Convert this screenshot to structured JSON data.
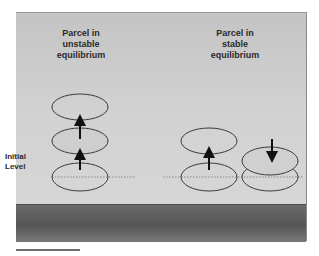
{
  "diagram": {
    "left_title": "Parcel in unstable equilibrium",
    "left_title_lines": [
      "Parcel in",
      "unstable",
      "equilibrium"
    ],
    "right_title": "Parcel in stable equilibrium",
    "right_title_lines": [
      "Parcel in",
      "stable",
      "equilibrium"
    ],
    "level_label_lines": [
      "Initial",
      "Level"
    ],
    "colors": {
      "background": "#d0d0d0",
      "ground": "#5e5e5e",
      "outline": "#3a3a3a",
      "arrow": "#111111",
      "level_line": "#777777"
    },
    "left_parcels": [
      "initial",
      "middle",
      "top"
    ],
    "right_parcels": [
      "initial-up",
      "displaced-up",
      "initial-down",
      "displaced-down"
    ],
    "arrows": {
      "left": [
        "up",
        "up"
      ],
      "right": [
        "up",
        "down"
      ]
    }
  }
}
